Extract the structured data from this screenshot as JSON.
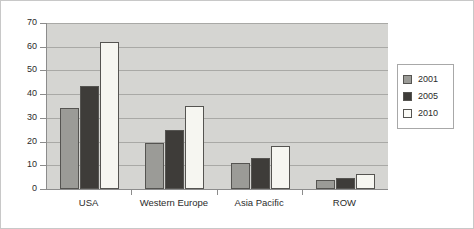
{
  "chart_data": {
    "type": "bar",
    "title": "",
    "xlabel": "",
    "ylabel": "",
    "ylim": [
      0,
      70
    ],
    "ytick_step": 10,
    "yticks": [
      0,
      10,
      20,
      30,
      40,
      50,
      60,
      70
    ],
    "grid": true,
    "legend_position": "right",
    "categories": [
      "USA",
      "Western Europe",
      "Asia Pacific",
      "ROW"
    ],
    "series": [
      {
        "name": "2001",
        "color": "#9b9b97",
        "values": [
          34,
          19.5,
          10.8,
          4
        ]
      },
      {
        "name": "2005",
        "color": "#3e3c39",
        "values": [
          43.5,
          25,
          13.2,
          4.7
        ]
      },
      {
        "name": "2010",
        "color": "#f6f6f1",
        "values": [
          62,
          35,
          18,
          6.5
        ]
      }
    ]
  },
  "legend": {
    "entries": [
      {
        "label": "2001"
      },
      {
        "label": "2005"
      },
      {
        "label": "2010"
      }
    ]
  },
  "colors": {
    "plot_background": "#d5d5d2",
    "page_background": "#ffffff",
    "gridline": "#a9a9a6",
    "axis": "#8c8c8c",
    "bar_outline": "#555451",
    "text": "#2b2b2b"
  }
}
